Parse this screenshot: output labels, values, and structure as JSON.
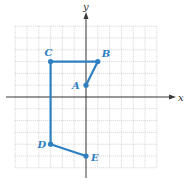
{
  "diagram": {
    "type": "coordinate-plane-polygonal-path",
    "axes": {
      "x_label": "x",
      "y_label": "y"
    },
    "grid": {
      "xmin": -6,
      "xmax": 6,
      "ymin": -6,
      "ymax": 6,
      "step": 1
    },
    "colors": {
      "path": "#2f7fc1",
      "grid": "#b9b9b9",
      "axis": "#3a3a3a"
    },
    "points": [
      {
        "label": "A",
        "x": 0,
        "y": 1
      },
      {
        "label": "B",
        "x": 1,
        "y": 3
      },
      {
        "label": "C",
        "x": -3,
        "y": 3
      },
      {
        "label": "D",
        "x": -3,
        "y": -4
      },
      {
        "label": "E",
        "x": 0,
        "y": -5
      }
    ],
    "path_order": [
      "A",
      "B",
      "C",
      "D",
      "E"
    ]
  }
}
